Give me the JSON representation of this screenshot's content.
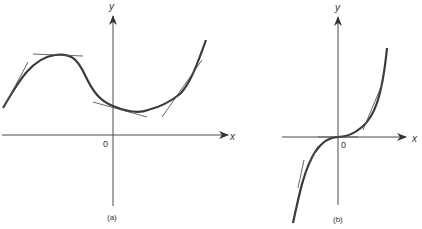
{
  "figure": {
    "panels": [
      {
        "id": "a",
        "caption": "(a)",
        "x_axis_label": "x",
        "y_axis_label": "y",
        "origin_label": "0",
        "description": "Curve with a local maximum (horizontal tangent) on the left and a local minimum to the right of the y-axis; tangent lines drawn at several points"
      },
      {
        "id": "b",
        "caption": "(b)",
        "x_axis_label": "x",
        "y_axis_label": "y",
        "origin_label": "0",
        "description": "Cubic-like curve through the origin with horizontal tangent (inflection) at 0; tangent lines drawn at several points"
      }
    ],
    "colors": {
      "curve": "#3a3a3a",
      "axis": "#4a4a4a",
      "tangent": "#555555"
    }
  }
}
